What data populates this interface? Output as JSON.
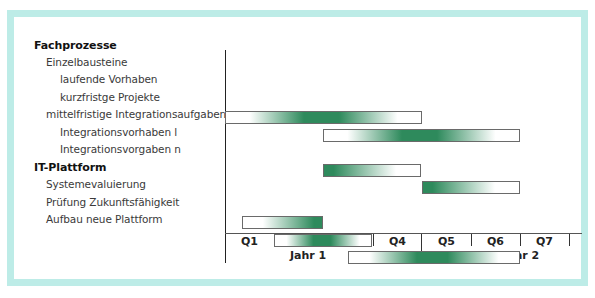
{
  "colors": {
    "frame": "#bdece7",
    "bar_green": "#2e8a5c",
    "bar_border": "#6a6a6a",
    "axis": "#222222"
  },
  "tasks": [
    {
      "label": "Fachprozesse",
      "level": 0,
      "bold": true
    },
    {
      "label": "Einzelbausteine",
      "level": 1,
      "bold": false
    },
    {
      "label": "laufende Vorhaben",
      "level": 2,
      "bold": false
    },
    {
      "label": "kurzfristge Projekte",
      "level": 2,
      "bold": false
    },
    {
      "label": "mittelfristige Integrationsaufgaben",
      "level": 1,
      "bold": false
    },
    {
      "label": "Integrationsvorhaben l",
      "level": 2,
      "bold": false
    },
    {
      "label": "Integrationsvorgaben n",
      "level": 2,
      "bold": false
    },
    {
      "label": "IT-Plattform",
      "level": 0,
      "bold": true
    },
    {
      "label": "Systemevaluierung",
      "level": 1,
      "bold": false
    },
    {
      "label": "Prüfung Zukunftsfähigkeit",
      "level": 1,
      "bold": false
    },
    {
      "label": "Aufbau neue Plattform",
      "level": 1,
      "bold": false
    }
  ],
  "axis": {
    "quarters": [
      "Q1",
      "Q2",
      "Q3",
      "Q4",
      "Q5",
      "Q6",
      "Q7"
    ],
    "years": [
      "Jahr 1",
      "Jahr 2"
    ]
  },
  "chart_data": {
    "type": "gantt",
    "title": "",
    "xlabel": "",
    "ylabel": "",
    "x_units": "quarters",
    "xlim": [
      0,
      7
    ],
    "categories": [
      "Q1",
      "Q2",
      "Q3",
      "Q4",
      "Q5",
      "Q6",
      "Q7"
    ],
    "year_groups": [
      {
        "label": "Jahr 1",
        "quarters": [
          "Q1",
          "Q2",
          "Q3",
          "Q4"
        ]
      },
      {
        "label": "Jahr 2",
        "quarters": [
          "Q5",
          "Q6",
          "Q7"
        ]
      }
    ],
    "bars": [
      {
        "task": "laufende Vorhaben",
        "start": 0.0,
        "end": 4.0,
        "gradient": "center"
      },
      {
        "task": "kurzfristge Projekte",
        "start": 2.0,
        "end": 6.0,
        "gradient": "center"
      },
      {
        "task": "Integrationsvorhaben l",
        "start": 2.0,
        "end": 4.0,
        "gradient": "left"
      },
      {
        "task": "Integrationsvorgaben n",
        "start": 4.0,
        "end": 6.0,
        "gradient": "left"
      },
      {
        "task": "Systemevaluierung",
        "start": 0.35,
        "end": 2.0,
        "gradient": "right"
      },
      {
        "task": "Prüfung Zukunftsfähigkeit",
        "start": 1.0,
        "end": 3.0,
        "gradient": "center"
      },
      {
        "task": "Aufbau neue Plattform",
        "start": 2.5,
        "end": 6.0,
        "gradient": "center"
      }
    ],
    "grid": false,
    "legend": null
  }
}
